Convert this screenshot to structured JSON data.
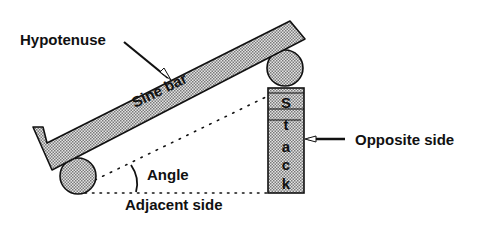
{
  "diagram": {
    "labels": {
      "hypotenuse": "Hypotenuse",
      "sine_bar": "Sine bar",
      "angle": "Angle",
      "adjacent": "Adjacent side",
      "opposite": "Opposite side",
      "stack": [
        "S",
        "t",
        "a",
        "c",
        "k"
      ]
    },
    "colors": {
      "fill": "#c8c8c8",
      "stroke": "#111111",
      "background": "#ffffff"
    }
  }
}
